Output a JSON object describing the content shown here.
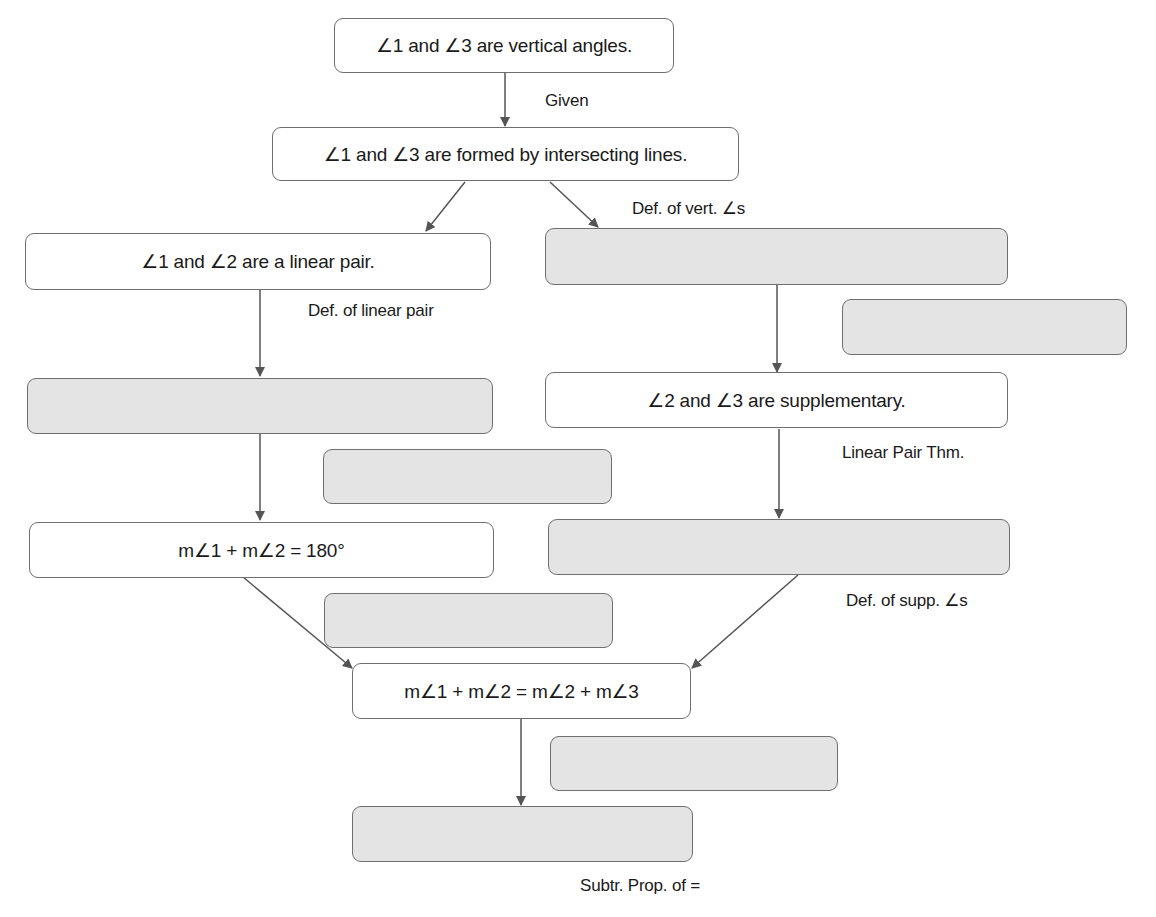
{
  "flowchart": {
    "statements": {
      "s1": "∠1 and ∠3 are vertical angles.",
      "s2": "∠1 and ∠3 are formed by intersecting lines.",
      "s3": "∠1 and ∠2 are a linear pair.",
      "s4_blank": "",
      "s5": "∠2 and ∠3 are supplementary.",
      "s6_blank": "",
      "s7": "m∠1 + m∠2 = 180°",
      "s8_blank": "",
      "s9": "m∠1 + m∠2 = m∠2 + m∠3",
      "s10_blank": ""
    },
    "reasons": {
      "r1": "Given",
      "r2": "Def. of vert. ∠s",
      "r3": "Def. of linear pair",
      "r4_blank": "",
      "r5": "Linear Pair Thm.",
      "r6_blank": "",
      "r7": "Def. of supp. ∠s",
      "r8_blank": "",
      "r9_blank": "",
      "r10": "Subtr. Prop. of ="
    },
    "colors": {
      "box_border": "#6f6f6f",
      "blank_fill": "#e4e4e4",
      "arrow": "#555555",
      "text": "#1a1a1a"
    }
  }
}
